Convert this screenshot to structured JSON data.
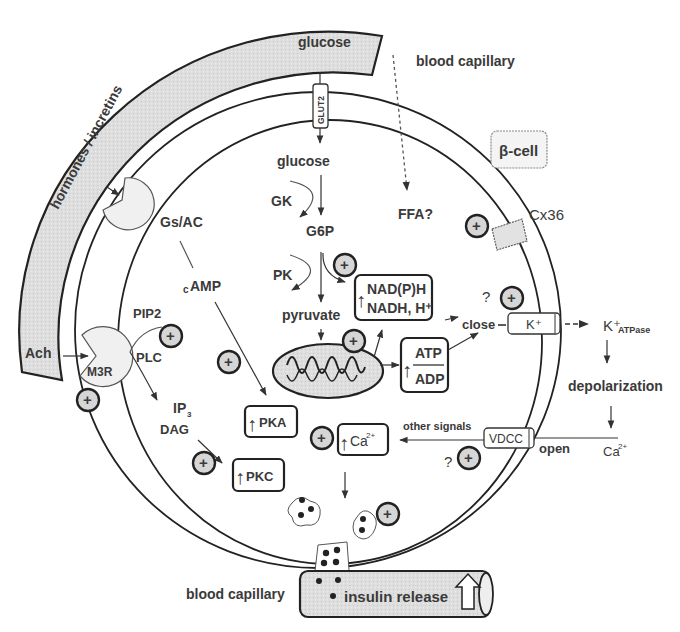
{
  "figure": {
    "cell_label": "β-cell",
    "capillary_top": {
      "label": "blood capillary",
      "content": "glucose"
    },
    "capillary_left": {
      "label": "hormones / incretins"
    },
    "capillary_bottom": {
      "label": "blood capillary",
      "content": "insulin release"
    },
    "membrane_proteins": {
      "glut2": "GLUT2",
      "cx36": "Cx36",
      "katp": "K⁺",
      "vdcc": "VDCC",
      "gs_ac": "Gs/AC",
      "m3r": "M3R"
    },
    "metabolism": {
      "glucose_in": "glucose",
      "gk": "GK",
      "g6p": "G6P",
      "pk": "PK",
      "pyruvate": "pyruvate",
      "ffa": "FFA?",
      "nadph_line1": "NAD(P)H",
      "nadph_line2": "NADH, H⁺",
      "atp": "ATP",
      "adp": "ADP"
    },
    "signaling": {
      "camp": "cAMP",
      "camp_prefix": "c",
      "camp_main": "AMP",
      "pip2": "PIP2",
      "plc": "PLC",
      "ip3": "IP",
      "ip3_sub": "3",
      "dag": "DAG",
      "pka": "PKA",
      "pkc": "PKC",
      "ca_in": "Ca",
      "ca_in_sup": "2+",
      "ach": "Ach",
      "other_signals": "other signals"
    },
    "electrical": {
      "close": "close",
      "k_out": "K⁺",
      "k_sub": "ATPase",
      "depolarization": "depolarization",
      "open": "open",
      "ca_out": "Ca",
      "ca_out_sup": "2+",
      "question": "?"
    },
    "symbols": {
      "plus": "+",
      "up_arrow": "↑"
    },
    "colors": {
      "ink": "#333333",
      "fill_gray": "#dcdcdc",
      "light_fill": "#f2f2f2",
      "background": "#ffffff"
    }
  }
}
